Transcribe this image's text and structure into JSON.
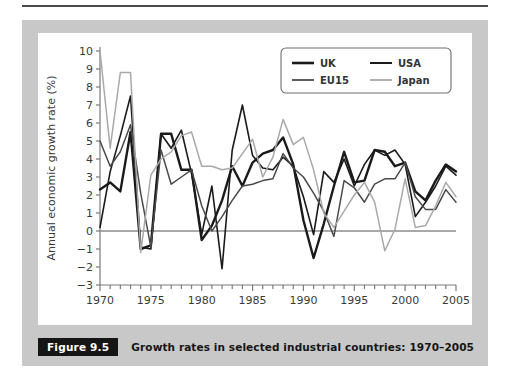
{
  "figure": {
    "badge_label": "Figure 9.5",
    "caption": "Growth rates in selected industrial countries: 1970–2005"
  },
  "colors": {
    "page_background": "#ffffff",
    "frame_gray": "#c8c8c8",
    "plot_background": "#ffffff",
    "badge_background": "#151515",
    "badge_text": "#ffffff",
    "axis": "#7a7a7a",
    "zero_line": "#8d8d8d",
    "uk": "#1a1a1a",
    "usa": "#1a1a1a",
    "eu15": "#4a4a4a",
    "japan": "#a9a9a9",
    "legend_border": "#6e6e6e",
    "top_rule": "#4a4a4a"
  },
  "chart_data": {
    "type": "line",
    "title": "Growth rates in selected industrial countries: 1970–2005",
    "xlabel": "",
    "ylabel": "Annual economic growth rate (%)",
    "xlim": [
      1970,
      2005
    ],
    "ylim": [
      -3,
      10
    ],
    "ytick_step": 1,
    "xtick_major_step": 5,
    "xtick_minor_step": 1,
    "grid": false,
    "zero_line": 0,
    "legend_position": "top-right",
    "yticks": [
      -3,
      -2,
      -1,
      0,
      1,
      2,
      3,
      4,
      5,
      6,
      7,
      8,
      9,
      10
    ],
    "ytick_labels": [
      "−3",
      "−2",
      "−1",
      "0",
      "1",
      "2",
      "3",
      "4",
      "5",
      "6",
      "7",
      "8",
      "9",
      "10"
    ],
    "xticks": [
      1970,
      1975,
      1980,
      1985,
      1990,
      1995,
      2000,
      2005
    ],
    "xtick_labels": [
      "1970",
      "1975",
      "1980",
      "1985",
      "1990",
      "1995",
      "2000",
      "2005"
    ],
    "x": [
      1970,
      1971,
      1972,
      1973,
      1974,
      1975,
      1976,
      1977,
      1978,
      1979,
      1980,
      1981,
      1982,
      1983,
      1984,
      1985,
      1986,
      1987,
      1988,
      1989,
      1990,
      1991,
      1992,
      1993,
      1994,
      1995,
      1996,
      1997,
      1998,
      1999,
      2000,
      2001,
      2002,
      2003,
      2004,
      2005
    ],
    "series": [
      {
        "name": "UK",
        "label": "UK",
        "color": "#1a1a1a",
        "width": 2.4,
        "values": [
          2.3,
          2.7,
          2.2,
          5.5,
          -1.0,
          -0.8,
          5.4,
          5.4,
          3.4,
          3.4,
          -0.5,
          0.3,
          1.7,
          3.6,
          2.5,
          3.8,
          4.3,
          4.5,
          5.2,
          3.7,
          0.6,
          -1.5,
          0.4,
          2.5,
          4.4,
          2.7,
          2.8,
          4.5,
          4.4,
          3.6,
          3.8,
          2.2,
          1.7,
          2.8,
          3.7,
          3.3
        ]
      },
      {
        "name": "USA",
        "label": "USA",
        "color": "#1a1a1a",
        "width": 1.6,
        "values": [
          0.2,
          3.3,
          5.3,
          7.5,
          -0.9,
          -1.0,
          5.4,
          4.6,
          5.6,
          3.2,
          -0.2,
          2.5,
          -2.1,
          4.5,
          7.0,
          4.2,
          3.5,
          3.4,
          4.1,
          3.6,
          1.9,
          -0.2,
          3.3,
          2.7,
          4.0,
          2.5,
          3.7,
          4.5,
          4.2,
          4.5,
          3.7,
          0.8,
          1.6,
          2.5,
          3.6,
          3.1
        ]
      },
      {
        "name": "EU15",
        "label": "EU15",
        "color": "#4a4a4a",
        "width": 1.5,
        "values": [
          5.0,
          3.6,
          4.4,
          5.9,
          2.1,
          -0.9,
          4.5,
          2.6,
          3.0,
          3.4,
          1.4,
          0.0,
          0.8,
          1.7,
          2.5,
          2.6,
          2.8,
          2.9,
          4.3,
          3.5,
          3.0,
          2.1,
          1.1,
          -0.3,
          2.8,
          2.4,
          1.6,
          2.6,
          2.9,
          2.9,
          3.8,
          1.9,
          1.2,
          1.2,
          2.3,
          1.6
        ]
      },
      {
        "name": "Japan",
        "label": "Japan",
        "color": "#a9a9a9",
        "width": 1.5,
        "values": [
          10.0,
          4.6,
          8.8,
          8.8,
          -1.2,
          3.1,
          4.0,
          4.4,
          5.3,
          5.5,
          3.6,
          3.6,
          3.4,
          3.5,
          4.3,
          5.1,
          3.0,
          4.1,
          6.2,
          4.8,
          5.2,
          3.4,
          1.0,
          0.2,
          1.1,
          2.0,
          2.7,
          1.6,
          -1.1,
          0.1,
          2.9,
          0.2,
          0.3,
          1.4,
          2.7,
          1.9
        ]
      }
    ]
  },
  "legend": {
    "entries": [
      {
        "label": "UK",
        "color": "#1a1a1a",
        "width": 2.6,
        "text_color": "#151515"
      },
      {
        "label": "USA",
        "color": "#1a1a1a",
        "width": 2.0,
        "text_color": "#151515"
      },
      {
        "label": "EU15",
        "color": "#4a4a4a",
        "width": 1.8,
        "text_color": "#151515"
      },
      {
        "label": "Japan",
        "color": "#a9a9a9",
        "width": 1.8,
        "text_color": "#9a9a9a"
      }
    ]
  }
}
